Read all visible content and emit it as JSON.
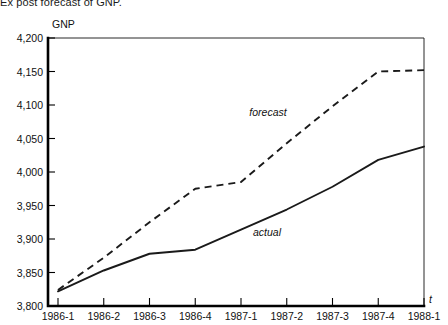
{
  "caption": "Ex post forecast of GNP.",
  "chart_data": {
    "type": "line",
    "title": "Ex post forecast of GNP.",
    "xlabel": "t",
    "ylabel": "GNP",
    "ylim": [
      3800,
      4200
    ],
    "ytick_step": 50,
    "grid": false,
    "legend_position": "inline-annotations",
    "ytick_labels": [
      "4,200",
      "4,150",
      "4,100",
      "4,050",
      "4,000",
      "3,950",
      "3,900",
      "3,850",
      "3,800"
    ],
    "ytick_values": [
      4200,
      4150,
      4100,
      4050,
      4000,
      3950,
      3900,
      3850,
      3800
    ],
    "categories": [
      "1986-1",
      "1986-2",
      "1986-3",
      "1986-4",
      "1987-1",
      "1987-2",
      "1987-3",
      "1987-4",
      "1988-1"
    ],
    "series": [
      {
        "name": "actual",
        "style": "solid",
        "values": [
          3822,
          3853,
          3878,
          3884,
          3914,
          3944,
          3978,
          4018,
          4038
        ]
      },
      {
        "name": "forecast",
        "style": "dashed",
        "values": [
          3824,
          3872,
          3925,
          3975,
          3985,
          4043,
          4098,
          4150,
          4152
        ]
      }
    ],
    "annotations": [
      {
        "text": "forecast",
        "x": "1987-1",
        "y": 4078
      },
      {
        "text": "actual",
        "x": "1987-2",
        "y": 3912
      }
    ]
  },
  "axis_titles": {
    "y": "GNP",
    "x": "t"
  }
}
